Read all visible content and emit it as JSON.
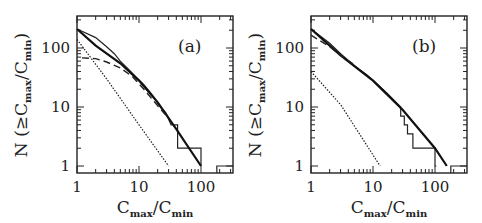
{
  "figure": {
    "panels": [
      "(a)",
      "(b)"
    ]
  },
  "chart_data": [
    {
      "type": "line",
      "panel_label": "(a)",
      "title": "",
      "xlabel": "C_max/C_min",
      "ylabel": "N (≥C_max/C_min)",
      "xscale": "log",
      "yscale": "log",
      "xlim": [
        1,
        330
      ],
      "ylim": [
        0.76,
        350
      ],
      "xticks": [
        "1",
        "10",
        "100"
      ],
      "yticks": [
        "1",
        "10",
        "100"
      ],
      "grid": false,
      "series": [
        {
          "name": "observed cumulative (stepped)",
          "style": "solid-thin-histogram",
          "x": [
            1,
            2,
            3,
            4,
            5,
            7,
            9,
            12,
            15,
            18,
            22,
            27,
            33,
            42,
            42,
            100,
            100
          ],
          "y": [
            210,
            150,
            105,
            80,
            60,
            42,
            32,
            24,
            18,
            14,
            10,
            8,
            5,
            5,
            2,
            2,
            1
          ]
        },
        {
          "name": "model fit (thick solid)",
          "style": "solid-thick",
          "x": [
            1,
            2,
            5,
            10,
            20,
            40,
            100
          ],
          "y": [
            210,
            110,
            55,
            28,
            12,
            4.2,
            1
          ]
        },
        {
          "name": "model (dashed)",
          "style": "dashed",
          "x": [
            1.2,
            2,
            3,
            5,
            8,
            12,
            18,
            25,
            30
          ],
          "y": [
            68,
            66,
            58,
            46,
            32,
            20,
            12,
            8,
            6.5
          ]
        },
        {
          "name": "model (dotted)",
          "style": "dotted",
          "x": [
            1,
            3,
            10,
            30
          ],
          "y": [
            140,
            30,
            5,
            1
          ]
        },
        {
          "name": "outlier bin",
          "style": "solid-thin-histogram",
          "x": [
            180,
            330
          ],
          "y": [
            1,
            1
          ]
        }
      ]
    },
    {
      "type": "line",
      "panel_label": "(b)",
      "title": "",
      "xlabel": "C_max/C_min",
      "ylabel": "N (≥C_max/C_min)",
      "xscale": "log",
      "yscale": "log",
      "xlim": [
        1,
        330
      ],
      "ylim": [
        0.76,
        350
      ],
      "xticks": [
        "1",
        "10",
        "100"
      ],
      "yticks": [
        "1",
        "10",
        "100"
      ],
      "grid": false,
      "series": [
        {
          "name": "observed cumulative (stepped)",
          "style": "solid-thin-histogram",
          "x": [
            1,
            2,
            3,
            5,
            8,
            12,
            17,
            22,
            28,
            28,
            32,
            32,
            36,
            36,
            44,
            44,
            100,
            100,
            105
          ],
          "y": [
            210,
            120,
            80,
            50,
            35,
            24,
            17,
            13,
            10,
            7,
            7,
            5,
            5,
            3.5,
            3.5,
            2,
            2,
            1,
            1
          ]
        },
        {
          "name": "model fit (thick solid)",
          "style": "solid-thick",
          "x": [
            1,
            3,
            10,
            30,
            100,
            155
          ],
          "y": [
            210,
            75,
            28,
            9,
            2,
            1
          ]
        },
        {
          "name": "model (dashed)",
          "style": "dashed",
          "x": [
            1,
            2,
            3,
            5
          ],
          "y": [
            165,
            105,
            75,
            52
          ]
        },
        {
          "name": "model (dotted)",
          "style": "dotted",
          "x": [
            1,
            3,
            13
          ],
          "y": [
            40,
            11,
            1
          ]
        },
        {
          "name": "outlier bin",
          "style": "solid-thin-histogram",
          "x": [
            180,
            330
          ],
          "y": [
            1,
            1
          ]
        }
      ]
    }
  ],
  "labels": {
    "a": {
      "panel": "(a)",
      "ytick_100": "100",
      "ytick_10": "10",
      "ytick_1": "1",
      "xtick_1": "1",
      "xtick_10": "10",
      "xtick_100": "100",
      "xlabel_main1": "C",
      "xlabel_sub1": "max",
      "xlabel_slash": "/",
      "xlabel_main2": "C",
      "xlabel_sub2": "min",
      "ylabel_prefix": "N (≥C",
      "ylabel_sub1": "max",
      "ylabel_mid": "/C",
      "ylabel_sub2": "min",
      "ylabel_suffix": ")"
    },
    "b": {
      "panel": "(b)",
      "ytick_100": "100",
      "ytick_10": "10",
      "ytick_1": "1",
      "xtick_1": "1",
      "xtick_10": "10",
      "xtick_100": "100",
      "xlabel_main1": "C",
      "xlabel_sub1": "max",
      "xlabel_slash": "/",
      "xlabel_main2": "C",
      "xlabel_sub2": "min",
      "ylabel_prefix": "N (≥C",
      "ylabel_sub1": "max",
      "ylabel_mid": "/C",
      "ylabel_sub2": "min",
      "ylabel_suffix": ")"
    }
  }
}
